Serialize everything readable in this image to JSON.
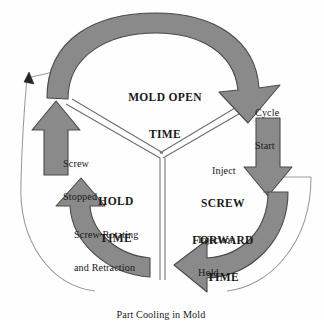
{
  "diagram": {
    "type": "cycle-diagram",
    "segment_count": 3,
    "colors": {
      "arrow_fill": "#8a8a8a",
      "arrow_stroke": "#4a4a4a",
      "thin_line": "#9a9a9a",
      "divider": "#6e6e6e",
      "text": "#1a1a1a",
      "background": "#fefefe"
    },
    "stages": [
      {
        "id": "mold-open",
        "label": "MOLD OPEN\nTIME",
        "label_line_1": "MOLD OPEN",
        "label_line_2": "TIME",
        "arc_direction": "clockwise",
        "arc_span_degrees": 120,
        "start_marker": "Cycle\nStart"
      },
      {
        "id": "screw-forward",
        "label": "SCREW\nFORWARD\nTIME",
        "label_line_1": "SCREW",
        "label_line_2": "FORWARD",
        "label_line_3": "TIME",
        "arc_direction": "clockwise",
        "arc_span_degrees": 120
      },
      {
        "id": "hold-time",
        "label": "HOLD\nTIME",
        "label_line_1": "HOLD",
        "label_line_2": "TIME",
        "arc_direction": "counter-clockwise-upward",
        "arc_span_degrees": 120
      }
    ],
    "annotations": [
      {
        "id": "cycle-start",
        "text": "Cycle\nStart",
        "line_1": "Cycle",
        "line_2": "Start",
        "near": "top-right"
      },
      {
        "id": "inject",
        "text": "Inject",
        "near": "right-upper"
      },
      {
        "id": "injection-hold",
        "text": "Injection\nHold",
        "line_1": "Injection",
        "line_2": "Hold",
        "near": "right-lower"
      },
      {
        "id": "screw-stopped",
        "text": "Screw\nStopped",
        "line_1": "Screw",
        "line_2": "Stopped",
        "near": "left-upper"
      },
      {
        "id": "screw-rotating",
        "text": "Screw Rotating\nand Retraction",
        "line_1": "Screw Rotating",
        "line_2": "and Retraction",
        "near": "left-lower"
      },
      {
        "id": "part-cooling",
        "text": "Part Cooling in Mold",
        "near": "bottom-center"
      }
    ],
    "arrows": [
      {
        "id": "mold-open-arc",
        "points_to": "cycle-start",
        "direction": "down-right",
        "style": "thick-curved"
      },
      {
        "id": "inject-arrow",
        "points_to": "screw-forward-time",
        "direction": "down",
        "style": "thick-straight"
      },
      {
        "id": "injection-hold-arc",
        "points_to": "part-cooling",
        "direction": "left",
        "style": "thick-curved"
      },
      {
        "id": "screw-rotating-arc",
        "points_to": "hold-time",
        "direction": "up",
        "style": "thick-curved"
      },
      {
        "id": "screw-stopped-arrow",
        "points_to": "mold-open-time",
        "direction": "up",
        "style": "thick-straight"
      },
      {
        "id": "part-cooling-bracket",
        "points_to": "cycle-restart",
        "direction": "up-left",
        "style": "thin-arc-with-arrowhead"
      }
    ]
  },
  "labels": {
    "mold_open_time_1": "MOLD OPEN",
    "mold_open_time_2": "TIME",
    "screw_forward_time_1": "SCREW",
    "screw_forward_time_2": "FORWARD",
    "screw_forward_time_3": "TIME",
    "hold_time_1": "HOLD",
    "hold_time_2": "TIME",
    "cycle_start_1": "Cycle",
    "cycle_start_2": "Start",
    "inject": "Inject",
    "injection_hold_1": "Injection",
    "injection_hold_2": "Hold",
    "screw_stopped_1": "Screw",
    "screw_stopped_2": "Stopped",
    "screw_rotating_1": "Screw Rotating",
    "screw_rotating_2": "and Retraction",
    "part_cooling": "Part Cooling in Mold"
  }
}
